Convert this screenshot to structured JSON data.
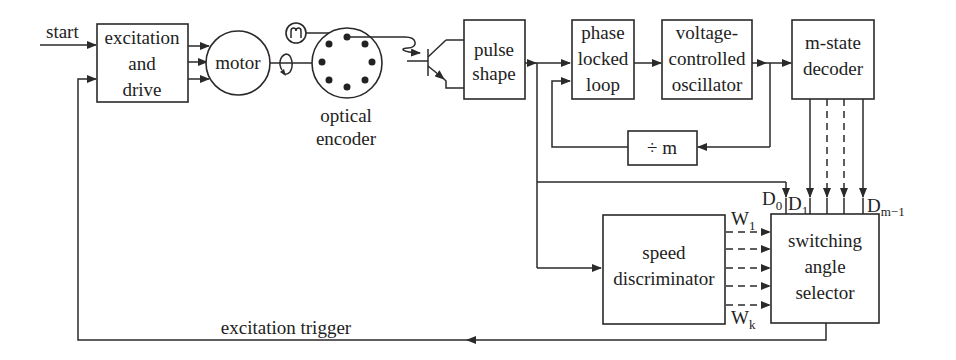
{
  "diagram": {
    "colors": {
      "line": "#2a2a2a",
      "text": "#222222",
      "background": "#ffffff"
    },
    "inputs": {
      "start": "start"
    },
    "blocks": {
      "excitation_drive": {
        "line1": "excitation",
        "line2": "and",
        "line3": "drive"
      },
      "motor": {
        "label": "motor"
      },
      "optical_encoder": {
        "line1": "optical",
        "line2": "encoder"
      },
      "pulse_shape": {
        "line1": "pulse",
        "line2": "shape"
      },
      "pll": {
        "line1": "phase",
        "line2": "locked",
        "line3": "loop"
      },
      "vco": {
        "line1": "voltage-",
        "line2": "controlled",
        "line3": "oscillator"
      },
      "divider": {
        "label": "÷ m"
      },
      "decoder": {
        "line1": "m-state",
        "line2": "decoder"
      },
      "speed_discriminator": {
        "line1": "speed",
        "line2": "discriminator"
      },
      "switching_selector": {
        "line1": "switching",
        "line2": "angle",
        "line3": "selector"
      }
    },
    "signals": {
      "d0": "D",
      "d0_sub": "0",
      "d1": "D",
      "d1_sub": "1",
      "dm": "D",
      "dm_sub": "m−1",
      "w1": "W",
      "w1_sub": "1",
      "wk": "W",
      "wk_sub": "k",
      "feedback": "excitation trigger"
    }
  }
}
